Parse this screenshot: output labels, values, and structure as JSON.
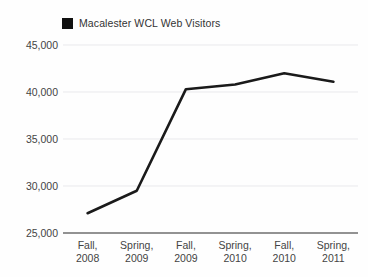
{
  "legend": {
    "entries": [
      {
        "label": "Macalester WCL Web Visitors",
        "color": "#111111",
        "swatch": "legend-swatch-icon"
      }
    ],
    "position": "top-left"
  },
  "axes": {
    "y_ticks": [
      "45,000",
      "40,000",
      "35,000",
      "30,000",
      "25,000"
    ],
    "x_ticks": [
      {
        "line1": "Fall,",
        "line2": "2008"
      },
      {
        "line1": "Spring,",
        "line2": "2009"
      },
      {
        "line1": "Fall,",
        "line2": "2009"
      },
      {
        "line1": "Spring,",
        "line2": "2010"
      },
      {
        "line1": "Fall,",
        "line2": "2010"
      },
      {
        "line1": "Spring,",
        "line2": "2011"
      }
    ]
  },
  "style": {
    "line_color": "#1a1a1a",
    "grid_color": "#e9e9ec",
    "axis_color": "#6e6e6e",
    "background": "#fefefe"
  },
  "chart_data": {
    "type": "line",
    "title": "",
    "xlabel": "",
    "ylabel": "",
    "categories": [
      "Fall, 2008",
      "Spring, 2009",
      "Fall, 2009",
      "Spring, 2010",
      "Fall, 2010",
      "Spring, 2011"
    ],
    "series": [
      {
        "name": "Macalester WCL Web Visitors",
        "color": "#1a1a1a",
        "values": [
          27100,
          29500,
          40300,
          40800,
          42000,
          41100
        ]
      }
    ],
    "ylim": [
      25000,
      45000
    ],
    "yticks": [
      25000,
      30000,
      35000,
      40000,
      45000
    ],
    "grid": true,
    "grid_axis": "y",
    "legend_position": "top-left",
    "markers": false
  }
}
